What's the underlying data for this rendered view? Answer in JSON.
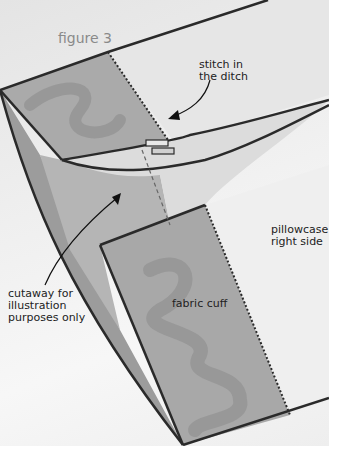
{
  "figure": {
    "title": "figure 3",
    "labels": {
      "stitch": [
        "stitch in",
        "the ditch"
      ],
      "pillowcase": [
        "pillowcase",
        "right side"
      ],
      "cutaway": [
        "cutaway for",
        "illustration",
        "purposes only"
      ],
      "cuff": "fabric cuff"
    },
    "colors": {
      "background": "#ececec",
      "cuff_fill": "#a9a9a9",
      "cuff_pattern": "#939393",
      "body_fill": "#d9d9d9",
      "inner_fill": "#b8b8b8",
      "outline": "#2a2a2a",
      "title_color": "#8a8a8a"
    }
  }
}
